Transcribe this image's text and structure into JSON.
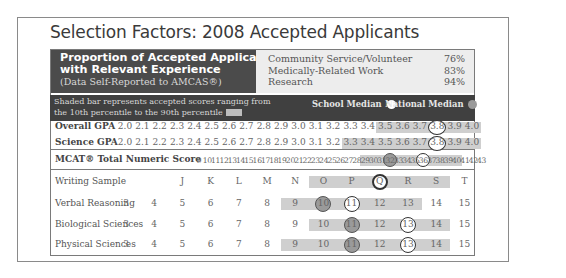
{
  "title": "Selection Factors: 2008 Accepted Applicants",
  "experience": {
    "heading_line1": "Proportion of Accepted Applicants",
    "heading_line2": "with Relevant Experience",
    "subheading": "(Data Self-Reported to AMCAS®)",
    "items": [
      {
        "label": "Community Service/Volunteer",
        "value": "76%"
      },
      {
        "label": "Medically-Related Work",
        "value": "83%"
      },
      {
        "label": "Research",
        "value": "94%"
      }
    ]
  },
  "legend": {
    "description": "Shaded bar represents accepted scores ranging from the 10th percentile to the 90th percentile",
    "school_median": "School Median",
    "national_median": "National Median",
    "colors": {
      "band": "#404040",
      "shade": "#cfcfcf",
      "school_dot": "#ffffff",
      "national_dot": "#9a9a9a"
    }
  },
  "chart_data": {
    "type": "table",
    "title": "Selection Factors: 2008 Accepted Applicants",
    "legend": [
      "Shaded bar: 10th-90th percentile of accepted scores",
      "School Median (white circle)",
      "National Median (gray circle)"
    ],
    "gpa": {
      "scale": [
        "2.0",
        "2.1",
        "2.2",
        "2.3",
        "2.4",
        "2.5",
        "2.6",
        "2.7",
        "2.8",
        "2.9",
        "3.0",
        "3.1",
        "3.2",
        "3.3",
        "3.4",
        "3.5",
        "3.6",
        "3.7",
        "3.8",
        "3.9",
        "4.0"
      ],
      "rows": [
        {
          "label": "Overall GPA",
          "shade_from": "3.5",
          "shade_to": "4.0",
          "school_median": "3.8",
          "national_median": null
        },
        {
          "label": "Science GPA",
          "shade_from": "3.3",
          "shade_to": "4.0",
          "school_median": "3.8",
          "national_median": null
        }
      ]
    },
    "mcat_total": {
      "label": "MCAT® Total Numeric Score",
      "scale": [
        "9",
        "10",
        "11",
        "12",
        "13",
        "14",
        "15",
        "16",
        "17",
        "18",
        "19",
        "20",
        "21",
        "22",
        "23",
        "24",
        "25",
        "26",
        "27",
        "28",
        "29",
        "30",
        "31",
        "32",
        "33",
        "34",
        "35",
        "36",
        "37",
        "38",
        "39",
        "40",
        "41",
        "42",
        "43"
      ],
      "shade_from": "29",
      "shade_to": "40",
      "school_median": "36",
      "national_median": "32"
    },
    "mcat_sections": {
      "rows": [
        {
          "label": "Writing Sample",
          "scale": [
            "",
            "",
            "J",
            "K",
            "L",
            "M",
            "N",
            "O",
            "P",
            "Q",
            "R",
            "S",
            "T"
          ],
          "shade_from": "O",
          "shade_to": "S",
          "school_median": "Q",
          "national_median": "Q"
        },
        {
          "label": "Verbal Reasoning",
          "scale": [
            "3",
            "4",
            "5",
            "6",
            "7",
            "8",
            "9",
            "10",
            "11",
            "12",
            "13",
            "14",
            "15"
          ],
          "shade_from": "9",
          "shade_to": "13",
          "school_median": "11",
          "national_median": "10"
        },
        {
          "label": "Biological Sciences",
          "scale": [
            "3",
            "4",
            "5",
            "6",
            "7",
            "8",
            "9",
            "10",
            "11",
            "12",
            "13",
            "14",
            "15"
          ],
          "shade_from": "10",
          "shade_to": "14",
          "school_median": "13",
          "national_median": "11"
        },
        {
          "label": "Physical Sciences",
          "scale": [
            "3",
            "4",
            "5",
            "6",
            "7",
            "8",
            "9",
            "10",
            "11",
            "12",
            "13",
            "14",
            "15"
          ],
          "shade_from": "9",
          "shade_to": "14",
          "school_median": "13",
          "national_median": "11"
        }
      ]
    }
  }
}
